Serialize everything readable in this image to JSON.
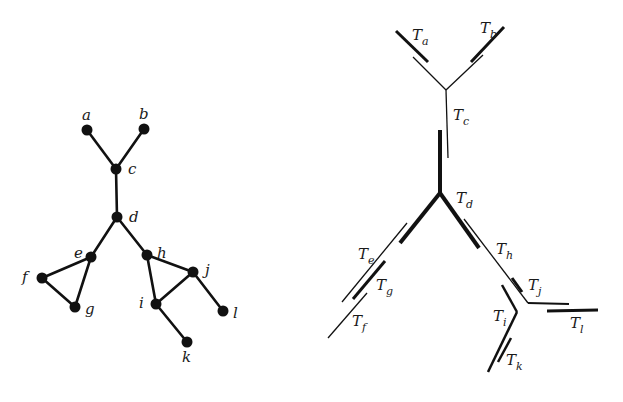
{
  "figure": {
    "left_panel": {
      "title": "graph",
      "nodes": [
        {
          "id": "a",
          "label": "a",
          "x": 87,
          "y": 130,
          "lx": 82,
          "ly": 120
        },
        {
          "id": "b",
          "label": "b",
          "x": 144,
          "y": 129,
          "lx": 139,
          "ly": 119
        },
        {
          "id": "c",
          "label": "c",
          "x": 116,
          "y": 169,
          "lx": 128,
          "ly": 174
        },
        {
          "id": "d",
          "label": "d",
          "x": 117,
          "y": 217,
          "lx": 129,
          "ly": 222
        },
        {
          "id": "e",
          "label": "e",
          "x": 91,
          "y": 257,
          "lx": 74,
          "ly": 258
        },
        {
          "id": "f",
          "label": "f",
          "x": 42,
          "y": 278,
          "lx": 22,
          "ly": 282
        },
        {
          "id": "g",
          "label": "g",
          "x": 75,
          "y": 307,
          "lx": 85,
          "ly": 314
        },
        {
          "id": "h",
          "label": "h",
          "x": 147,
          "y": 255,
          "lx": 157,
          "ly": 258
        },
        {
          "id": "j",
          "label": "j",
          "x": 193,
          "y": 272,
          "lx": 205,
          "ly": 275
        },
        {
          "id": "i",
          "label": "i",
          "x": 156,
          "y": 304,
          "lx": 139,
          "ly": 308
        },
        {
          "id": "l",
          "label": "l",
          "x": 223,
          "y": 311,
          "lx": 233,
          "ly": 318
        },
        {
          "id": "k",
          "label": "k",
          "x": 187,
          "y": 342,
          "lx": 182,
          "ly": 362
        }
      ],
      "edges": [
        [
          "a",
          "c"
        ],
        [
          "b",
          "c"
        ],
        [
          "c",
          "d"
        ],
        [
          "d",
          "e"
        ],
        [
          "d",
          "h"
        ],
        [
          "e",
          "f"
        ],
        [
          "e",
          "g"
        ],
        [
          "f",
          "g"
        ],
        [
          "h",
          "i"
        ],
        [
          "h",
          "j"
        ],
        [
          "i",
          "j"
        ],
        [
          "i",
          "k"
        ],
        [
          "j",
          "l"
        ]
      ]
    },
    "right_panel": {
      "title": "tree decomposition",
      "segments": [
        {
          "name": "Ta-thick",
          "x1": 396,
          "y1": 31,
          "x2": 428,
          "y2": 62,
          "w": 3
        },
        {
          "name": "Ta-thin",
          "x1": 413,
          "y1": 57,
          "x2": 446,
          "y2": 90,
          "w": 1.3
        },
        {
          "name": "Tb-thick",
          "x1": 504,
          "y1": 27,
          "x2": 471,
          "y2": 62,
          "w": 3
        },
        {
          "name": "Tb-thin",
          "x1": 483,
          "y1": 55,
          "x2": 446,
          "y2": 90,
          "w": 1.3
        },
        {
          "name": "Tc-thin",
          "x1": 446,
          "y1": 90,
          "x2": 448,
          "y2": 158,
          "w": 1.3
        },
        {
          "name": "Td-vertical",
          "x1": 440,
          "y1": 130,
          "x2": 440,
          "y2": 193,
          "w": 4
        },
        {
          "name": "Td-left",
          "x1": 440,
          "y1": 193,
          "x2": 400,
          "y2": 243,
          "w": 4
        },
        {
          "name": "Td-right",
          "x1": 440,
          "y1": 193,
          "x2": 479,
          "y2": 248,
          "w": 4
        },
        {
          "name": "Te-thin",
          "x1": 407,
          "y1": 223,
          "x2": 342,
          "y2": 302,
          "w": 1.3
        },
        {
          "name": "Tg-thick",
          "x1": 385,
          "y1": 261,
          "x2": 353,
          "y2": 299,
          "w": 3
        },
        {
          "name": "Tf-thin",
          "x1": 367,
          "y1": 293,
          "x2": 328,
          "y2": 338,
          "w": 1.3
        },
        {
          "name": "Th-thin",
          "x1": 464,
          "y1": 219,
          "x2": 528,
          "y2": 303,
          "w": 1.3
        },
        {
          "name": "Tj-thick",
          "x1": 512,
          "y1": 278,
          "x2": 522,
          "y2": 292,
          "w": 3
        },
        {
          "name": "Tj-horizontal",
          "x1": 528,
          "y1": 303,
          "x2": 569,
          "y2": 304,
          "w": 2
        },
        {
          "name": "Tl-thick",
          "x1": 547,
          "y1": 311,
          "x2": 598,
          "y2": 310,
          "w": 3
        },
        {
          "name": "Ti-upper",
          "x1": 502,
          "y1": 285,
          "x2": 517,
          "y2": 312,
          "w": 2.5
        },
        {
          "name": "Ti-lower",
          "x1": 517,
          "y1": 312,
          "x2": 488,
          "y2": 372,
          "w": 2.5
        },
        {
          "name": "Tk-thick",
          "x1": 511,
          "y1": 338,
          "x2": 498,
          "y2": 362,
          "w": 2.5
        }
      ],
      "labels": [
        {
          "main": "T",
          "sub": "a",
          "x": 412,
          "y": 40
        },
        {
          "main": "T",
          "sub": "b",
          "x": 480,
          "y": 33
        },
        {
          "main": "T",
          "sub": "c",
          "x": 453,
          "y": 120
        },
        {
          "main": "T",
          "sub": "d",
          "x": 456,
          "y": 203
        },
        {
          "main": "T",
          "sub": "e",
          "x": 358,
          "y": 259
        },
        {
          "main": "T",
          "sub": "g",
          "x": 376,
          "y": 290
        },
        {
          "main": "T",
          "sub": "f",
          "x": 352,
          "y": 326
        },
        {
          "main": "T",
          "sub": "h",
          "x": 496,
          "y": 254
        },
        {
          "main": "T",
          "sub": "j",
          "x": 528,
          "y": 290
        },
        {
          "main": "T",
          "sub": "i",
          "x": 493,
          "y": 321
        },
        {
          "main": "T",
          "sub": "l",
          "x": 570,
          "y": 328
        },
        {
          "main": "T",
          "sub": "k",
          "x": 506,
          "y": 365
        }
      ]
    }
  }
}
